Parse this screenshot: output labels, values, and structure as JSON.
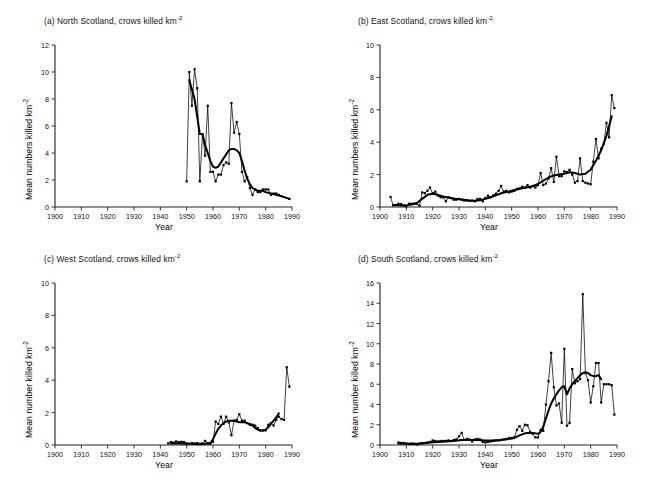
{
  "figure": {
    "background": "#ffffff",
    "line_color": "#000000",
    "panel_count": 4
  },
  "chart_data": [
    {
      "id": "a",
      "type": "line",
      "title": "(a) North Scotland, crows killed km-2",
      "title_prefix": "(a)",
      "title_region": "North Scotland, crows killed km",
      "title_exponent": "-2",
      "xlabel": "Year",
      "ylabel": "Mean numbers killed km",
      "ylabel_exponent": "-2",
      "xlim": [
        1900,
        1990
      ],
      "ylim": [
        0,
        12
      ],
      "xticks": [
        1900,
        1910,
        1920,
        1930,
        1940,
        1950,
        1960,
        1970,
        1980,
        1990
      ],
      "yticks": [
        0,
        2,
        4,
        6,
        8,
        10,
        12
      ],
      "grid": false,
      "legend": "none",
      "series": [
        {
          "name": "annual",
          "style": "thin-line-with-square-markers",
          "x": [
            1950,
            1951,
            1952,
            1953,
            1954,
            1955,
            1956,
            1957,
            1958,
            1959,
            1960,
            1961,
            1962,
            1963,
            1964,
            1965,
            1966,
            1967,
            1968,
            1969,
            1970,
            1971,
            1972,
            1973,
            1974,
            1975,
            1976,
            1977,
            1978,
            1979,
            1980,
            1981,
            1982,
            1983,
            1984,
            1985,
            1989
          ],
          "values": [
            1.9,
            10.0,
            7.5,
            10.2,
            8.8,
            1.9,
            5.4,
            3.8,
            7.5,
            2.6,
            2.6,
            1.9,
            2.4,
            2.4,
            3.1,
            3.3,
            3.2,
            7.7,
            5.5,
            6.3,
            5.4,
            2.6,
            1.9,
            2.2,
            1.4,
            0.9,
            1.3,
            1.1,
            1.1,
            1.3,
            1.3,
            1.3,
            0.9,
            1.0,
            1.0,
            0.9,
            0.6
          ]
        },
        {
          "name": "smoothed trend",
          "style": "thick-line",
          "x": [
            1951,
            1953,
            1955,
            1956,
            1957,
            1958,
            1959,
            1960,
            1961,
            1962,
            1963,
            1964,
            1965,
            1966,
            1967,
            1968,
            1969,
            1970,
            1971,
            1972,
            1973,
            1974,
            1975,
            1976,
            1977,
            1978,
            1979,
            1980,
            1982,
            1984,
            1986,
            1989
          ],
          "values": [
            9.4,
            8.0,
            5.4,
            5.4,
            4.6,
            4.0,
            3.4,
            3.0,
            2.9,
            3.0,
            3.3,
            3.6,
            3.9,
            4.2,
            4.3,
            4.3,
            4.2,
            4.0,
            3.4,
            2.7,
            2.1,
            1.7,
            1.4,
            1.3,
            1.2,
            1.2,
            1.2,
            1.1,
            1.0,
            0.9,
            0.8,
            0.6
          ]
        }
      ]
    },
    {
      "id": "b",
      "type": "line",
      "title": "(b) East Scotland, crows killed km-2",
      "title_prefix": "(b)",
      "title_region": "East Scotland, crows killed km",
      "title_exponent": "-2",
      "xlabel": "Year",
      "ylabel": "Mean numbers killed km",
      "ylabel_exponent": "-2",
      "xlim": [
        1900,
        1990
      ],
      "ylim": [
        0,
        10
      ],
      "xticks": [
        1900,
        1910,
        1920,
        1930,
        1940,
        1950,
        1960,
        1970,
        1980,
        1990
      ],
      "yticks": [
        0,
        2,
        4,
        6,
        8,
        10
      ],
      "grid": false,
      "legend": "none",
      "series": [
        {
          "name": "annual",
          "style": "thin-line-with-square-markers",
          "x": [
            1904,
            1905,
            1906,
            1907,
            1908,
            1909,
            1910,
            1911,
            1912,
            1913,
            1914,
            1915,
            1916,
            1917,
            1918,
            1919,
            1920,
            1921,
            1922,
            1923,
            1924,
            1925,
            1926,
            1927,
            1928,
            1929,
            1930,
            1931,
            1932,
            1933,
            1934,
            1935,
            1936,
            1937,
            1938,
            1939,
            1940,
            1941,
            1942,
            1943,
            1944,
            1945,
            1946,
            1947,
            1948,
            1949,
            1950,
            1951,
            1952,
            1953,
            1954,
            1955,
            1956,
            1957,
            1958,
            1959,
            1960,
            1961,
            1962,
            1963,
            1964,
            1965,
            1966,
            1967,
            1968,
            1969,
            1970,
            1971,
            1972,
            1973,
            1974,
            1975,
            1976,
            1977,
            1978,
            1979,
            1980,
            1981,
            1982,
            1983,
            1984,
            1985,
            1986,
            1987,
            1988,
            1989
          ],
          "values": [
            0.62,
            0.1,
            0.12,
            0.2,
            0.18,
            0.1,
            0.05,
            0.2,
            0.2,
            0.2,
            0.2,
            0.08,
            0.9,
            0.85,
            1.0,
            1.2,
            0.85,
            0.95,
            0.7,
            0.6,
            0.6,
            0.35,
            0.6,
            0.55,
            0.45,
            0.45,
            0.5,
            0.45,
            0.4,
            0.4,
            0.38,
            0.4,
            0.35,
            0.5,
            0.5,
            0.35,
            0.55,
            0.7,
            0.6,
            0.72,
            0.82,
            1.0,
            1.3,
            0.95,
            1.0,
            0.9,
            0.95,
            1.0,
            1.12,
            1.15,
            1.25,
            1.2,
            1.35,
            1.2,
            1.3,
            1.2,
            1.35,
            2.1,
            1.35,
            1.45,
            1.75,
            2.4,
            1.55,
            3.1,
            1.9,
            1.9,
            2.2,
            2.15,
            2.3,
            2.0,
            1.5,
            1.6,
            3.0,
            1.6,
            1.5,
            1.45,
            1.4,
            2.8,
            4.2,
            3.0,
            3.6,
            3.9,
            5.2,
            4.3,
            6.9,
            6.1
          ]
        },
        {
          "name": "smoothed trend",
          "style": "thick-line",
          "x": [
            1905,
            1908,
            1910,
            1912,
            1914,
            1916,
            1918,
            1920,
            1922,
            1924,
            1926,
            1928,
            1930,
            1932,
            1934,
            1936,
            1938,
            1940,
            1942,
            1944,
            1946,
            1948,
            1950,
            1952,
            1954,
            1956,
            1958,
            1960,
            1962,
            1964,
            1966,
            1968,
            1970,
            1972,
            1974,
            1976,
            1978,
            1980,
            1982,
            1984,
            1986,
            1988
          ],
          "values": [
            0.12,
            0.1,
            0.1,
            0.15,
            0.25,
            0.5,
            0.75,
            0.82,
            0.75,
            0.65,
            0.58,
            0.52,
            0.48,
            0.45,
            0.4,
            0.38,
            0.42,
            0.5,
            0.6,
            0.72,
            0.85,
            0.92,
            1.0,
            1.08,
            1.15,
            1.22,
            1.28,
            1.42,
            1.62,
            1.82,
            1.95,
            2.0,
            2.05,
            2.15,
            2.1,
            2.0,
            2.05,
            2.3,
            2.85,
            3.5,
            4.4,
            5.6
          ]
        }
      ]
    },
    {
      "id": "c",
      "type": "line",
      "title": "(c) West Scotland, crows killed km-2",
      "title_prefix": "(c)",
      "title_region": "West Scotland, crows killed km",
      "title_exponent": "-2",
      "xlabel": "Year",
      "ylabel": "Mean number killed km",
      "ylabel_exponent": "-2",
      "xlim": [
        1900,
        1990
      ],
      "ylim": [
        0,
        10
      ],
      "xticks": [
        1900,
        1910,
        1920,
        1930,
        1940,
        1950,
        1960,
        1970,
        1980,
        1990
      ],
      "yticks": [
        0,
        2,
        4,
        6,
        8,
        10
      ],
      "grid": false,
      "legend": "none",
      "series": [
        {
          "name": "annual",
          "style": "thin-line-with-square-markers",
          "x": [
            1943,
            1944,
            1945,
            1946,
            1947,
            1948,
            1949,
            1950,
            1951,
            1952,
            1953,
            1954,
            1955,
            1956,
            1957,
            1958,
            1959,
            1960,
            1961,
            1962,
            1963,
            1964,
            1965,
            1966,
            1967,
            1968,
            1969,
            1970,
            1971,
            1972,
            1973,
            1974,
            1975,
            1976,
            1977,
            1978,
            1979,
            1980,
            1981,
            1982,
            1983,
            1984,
            1985,
            1986,
            1987,
            1988,
            1989
          ],
          "values": [
            0.1,
            0.18,
            0.15,
            0.22,
            0.18,
            0.2,
            0.18,
            0.1,
            0.08,
            0.12,
            0.1,
            0.12,
            0.08,
            0.1,
            0.25,
            0.12,
            0.1,
            0.2,
            1.45,
            1.3,
            1.75,
            1.3,
            1.75,
            1.4,
            0.6,
            1.5,
            1.55,
            1.9,
            1.5,
            1.5,
            1.35,
            1.25,
            1.25,
            1.2,
            1.05,
            0.9,
            0.9,
            0.9,
            1.25,
            1.35,
            1.2,
            1.55,
            1.75,
            1.6,
            1.55,
            4.8,
            3.6
          ]
        },
        {
          "name": "smoothed trend",
          "style": "thick-line",
          "x": [
            1944,
            1947,
            1950,
            1953,
            1955,
            1957,
            1959,
            1960,
            1961,
            1962,
            1963,
            1964,
            1965,
            1966,
            1967,
            1968,
            1969,
            1970,
            1971,
            1972,
            1973,
            1974,
            1975,
            1976,
            1977,
            1978,
            1979,
            1980,
            1981,
            1982,
            1983,
            1984,
            1985
          ],
          "values": [
            0.1,
            0.1,
            0.08,
            0.06,
            0.05,
            0.08,
            0.1,
            0.35,
            0.7,
            1.0,
            1.2,
            1.35,
            1.45,
            1.5,
            1.5,
            1.5,
            1.45,
            1.4,
            1.4,
            1.4,
            1.35,
            1.3,
            1.2,
            1.05,
            0.95,
            0.9,
            0.9,
            0.95,
            1.1,
            1.3,
            1.5,
            1.7,
            1.95
          ]
        }
      ]
    },
    {
      "id": "d",
      "type": "line",
      "title": "(d) South Scotland, crows killed km-2",
      "title_prefix": "(d)",
      "title_region": "South Scotland, crows killed km",
      "title_exponent": "-2",
      "xlabel": "Year",
      "ylabel": "Mean number killed km",
      "ylabel_exponent": "-2",
      "xlim": [
        1900,
        1990
      ],
      "ylim": [
        0,
        16
      ],
      "xticks": [
        1900,
        1910,
        1920,
        1930,
        1940,
        1950,
        1960,
        1970,
        1980,
        1990
      ],
      "yticks": [
        0,
        2,
        4,
        6,
        8,
        10,
        12,
        14,
        16
      ],
      "grid": false,
      "legend": "none",
      "series": [
        {
          "name": "annual",
          "style": "thin-line-with-square-markers",
          "x": [
            1907,
            1908,
            1909,
            1910,
            1911,
            1912,
            1913,
            1914,
            1915,
            1916,
            1917,
            1918,
            1919,
            1920,
            1921,
            1922,
            1923,
            1924,
            1925,
            1926,
            1927,
            1928,
            1929,
            1930,
            1931,
            1932,
            1933,
            1934,
            1935,
            1936,
            1937,
            1938,
            1939,
            1940,
            1941,
            1942,
            1943,
            1944,
            1945,
            1946,
            1947,
            1948,
            1949,
            1950,
            1951,
            1952,
            1953,
            1954,
            1955,
            1956,
            1957,
            1958,
            1959,
            1960,
            1961,
            1962,
            1963,
            1964,
            1965,
            1966,
            1967,
            1968,
            1969,
            1970,
            1971,
            1972,
            1973,
            1974,
            1975,
            1976,
            1977,
            1978,
            1979,
            1980,
            1981,
            1982,
            1983,
            1984,
            1985,
            1986,
            1987,
            1988,
            1989
          ],
          "values": [
            0.25,
            0.2,
            0.2,
            0.15,
            0.1,
            0.15,
            0.1,
            0.05,
            0.15,
            0.2,
            0.2,
            0.25,
            0.3,
            0.45,
            0.4,
            0.35,
            0.4,
            0.4,
            0.4,
            0.45,
            0.4,
            0.5,
            0.55,
            0.85,
            1.2,
            0.5,
            0.6,
            0.55,
            0.35,
            0.55,
            0.6,
            0.55,
            0.3,
            0.25,
            0.3,
            0.35,
            0.4,
            0.45,
            0.45,
            0.5,
            0.55,
            0.6,
            0.7,
            0.7,
            0.75,
            1.5,
            1.85,
            1.4,
            2.0,
            1.95,
            1.3,
            1.1,
            0.75,
            0.75,
            1.5,
            1.4,
            4.0,
            6.3,
            9.1,
            5.7,
            3.9,
            4.1,
            2.2,
            9.5,
            1.9,
            2.2,
            7.5,
            6.1,
            6.3,
            6.5,
            14.9,
            7.1,
            6.4,
            4.2,
            5.8,
            8.1,
            8.1,
            4.2,
            6.0,
            6.0,
            6.0,
            5.9,
            3.0
          ]
        },
        {
          "name": "smoothed trend",
          "style": "thick-line",
          "x": [
            1907,
            1910,
            1913,
            1916,
            1919,
            1922,
            1925,
            1928,
            1931,
            1934,
            1937,
            1940,
            1943,
            1946,
            1949,
            1951,
            1953,
            1955,
            1957,
            1959,
            1960,
            1961,
            1962,
            1963,
            1964,
            1965,
            1966,
            1967,
            1968,
            1969,
            1970,
            1971,
            1972,
            1973,
            1974,
            1975,
            1976,
            1977,
            1978,
            1979,
            1980,
            1981,
            1982,
            1983,
            1984
          ],
          "values": [
            0.15,
            0.12,
            0.12,
            0.15,
            0.25,
            0.3,
            0.35,
            0.4,
            0.5,
            0.5,
            0.5,
            0.45,
            0.45,
            0.5,
            0.6,
            0.7,
            0.95,
            1.15,
            1.2,
            1.15,
            1.1,
            1.3,
            1.8,
            2.6,
            3.4,
            4.1,
            4.6,
            5.0,
            5.4,
            5.7,
            5.8,
            5.0,
            5.6,
            6.0,
            6.3,
            6.6,
            6.9,
            7.1,
            7.2,
            7.1,
            6.9,
            6.8,
            6.8,
            6.9,
            6.5
          ]
        }
      ]
    }
  ]
}
